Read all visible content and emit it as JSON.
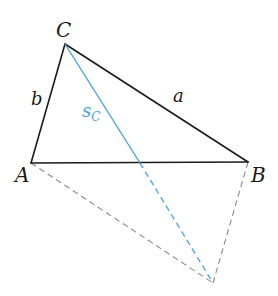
{
  "diagram": {
    "type": "triangle-median-construction",
    "vertices": {
      "A": {
        "label": "A",
        "x": 31,
        "y": 163
      },
      "B": {
        "label": "B",
        "x": 248,
        "y": 162
      },
      "C": {
        "label": "C",
        "x": 65,
        "y": 44
      },
      "D": {
        "x": 213,
        "y": 283
      }
    },
    "midpoint_AB": {
      "x": 140,
      "y": 163
    },
    "sides": {
      "a": {
        "label": "a",
        "from": "B",
        "to": "C"
      },
      "b": {
        "label": "b",
        "from": "A",
        "to": "C"
      },
      "c": {
        "from": "A",
        "to": "B"
      }
    },
    "median": {
      "label_main": "s",
      "label_sub": "C",
      "from": "C",
      "to": "midpoint_AB",
      "extension_to": "D"
    },
    "dashed_lines": [
      {
        "from": "A",
        "to": "D"
      },
      {
        "from": "B",
        "to": "D"
      }
    ],
    "colors": {
      "stroke": "#1a1a1a",
      "median": "#4aa3d6",
      "dashed": "#8a8a8a",
      "background": "#ffffff"
    }
  }
}
